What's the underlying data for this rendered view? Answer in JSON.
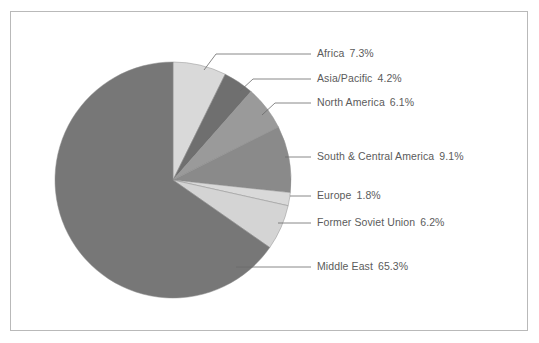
{
  "chart_data": {
    "type": "pie",
    "title": "",
    "subtitle": "",
    "xlabel": "",
    "ylabel": "",
    "legend_position": "callout-labels-right",
    "grid": false,
    "start_angle_deg": 0,
    "direction": "clockwise",
    "categories": [
      "Africa",
      "Asia/Pacific",
      "North America",
      "South & Central America",
      "Europe",
      "Former Soviet Union",
      "Middle East"
    ],
    "values": [
      7.3,
      4.2,
      6.1,
      9.1,
      1.8,
      6.2,
      65.3
    ],
    "value_suffix": "%",
    "slice_colors": [
      "#d9d9d9",
      "#6f6f6f",
      "#9a9a9a",
      "#8a8a8a",
      "#d9d9d9",
      "#d4d4d4",
      "#777777"
    ],
    "slices": [
      {
        "label": "Africa",
        "value": 7.3,
        "display": "7.3%",
        "color": "#d9d9d9"
      },
      {
        "label": "Asia/Pacific",
        "value": 4.2,
        "display": "4.2%",
        "color": "#6f6f6f"
      },
      {
        "label": "North America",
        "value": 6.1,
        "display": "6.1%",
        "color": "#9a9a9a"
      },
      {
        "label": "South & Central America",
        "value": 9.1,
        "display": "9.1%",
        "color": "#8a8a8a"
      },
      {
        "label": "Europe",
        "value": 1.8,
        "display": "1.8%",
        "color": "#d9d9d9"
      },
      {
        "label": "Former Soviet Union",
        "value": 6.2,
        "display": "6.2%",
        "color": "#d4d4d4"
      },
      {
        "label": "Middle East",
        "value": 65.3,
        "display": "65.3%",
        "color": "#777777"
      }
    ]
  },
  "labels": {
    "africa": {
      "name": "Africa",
      "value": "7.3%"
    },
    "asia_pacific": {
      "name": "Asia/Pacific",
      "value": "4.2%"
    },
    "north_america": {
      "name": "North America",
      "value": "6.1%"
    },
    "south_central_america": {
      "name": "South & Central America",
      "value": "9.1%"
    },
    "europe": {
      "name": "Europe",
      "value": "1.8%"
    },
    "former_soviet_union": {
      "name": "Former Soviet Union",
      "value": "6.2%"
    },
    "middle_east": {
      "name": "Middle East",
      "value": "65.3%"
    }
  },
  "colors": {
    "frame_border": "#b9b9b9",
    "label_text": "#5b5b5b",
    "leader_line": "#6a6a6a",
    "background": "#ffffff"
  }
}
